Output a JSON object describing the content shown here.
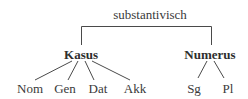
{
  "diagram": {
    "type": "tree",
    "root": {
      "label": "substantivisch",
      "children": [
        {
          "label": "Kasus",
          "children": [
            {
              "label": "Nom"
            },
            {
              "label": "Gen"
            },
            {
              "label": "Dat"
            },
            {
              "label": "Akk"
            }
          ]
        },
        {
          "label": "Numerus",
          "children": [
            {
              "label": "Sg"
            },
            {
              "label": "Pl"
            }
          ]
        }
      ]
    },
    "line_color": "#4a4a4a",
    "text_color": "#3a3a3a"
  }
}
